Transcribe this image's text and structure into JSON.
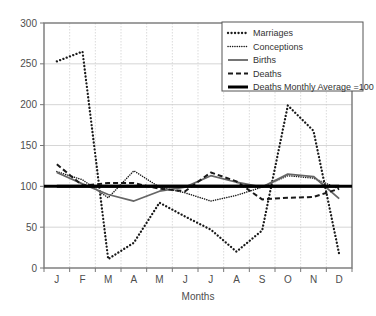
{
  "chart_data": {
    "type": "line",
    "title": "",
    "subtitle": "",
    "xlabel": "Months",
    "ylabel": "",
    "categories": [
      "J",
      "F",
      "M",
      "A",
      "M",
      "J",
      "J",
      "A",
      "S",
      "O",
      "N",
      "D"
    ],
    "category_names": [
      "January",
      "February",
      "March",
      "April",
      "May",
      "June",
      "July",
      "August",
      "September",
      "October",
      "November",
      "December"
    ],
    "ylim": [
      0,
      300
    ],
    "yticks": [
      0,
      50,
      100,
      150,
      200,
      250,
      300
    ],
    "ytick_labels": [
      "0",
      "50",
      "100",
      "150",
      "200",
      "250",
      "300"
    ],
    "grid": true,
    "grid_color": "#cccccc",
    "legend_position": "top-right",
    "reference_line": {
      "label": "Deaths Monthly Average =100",
      "value": 100,
      "color": "#000000"
    },
    "series": [
      {
        "name": "Marriages",
        "style": "dotted-coarse",
        "color": "#1a1a1a",
        "values": [
          253,
          265,
          11,
          31,
          80,
          63,
          47,
          20,
          46,
          199,
          168,
          17
        ]
      },
      {
        "name": "Conceptions",
        "style": "dotted-fine",
        "color": "#1a1a1a",
        "values": [
          118,
          108,
          86,
          119,
          99,
          92,
          82,
          89,
          99,
          113,
          110,
          97
        ]
      },
      {
        "name": "Births",
        "style": "solid",
        "color": "#666666",
        "values": [
          117,
          103,
          90,
          82,
          94,
          99,
          113,
          105,
          99,
          115,
          112,
          85
        ]
      },
      {
        "name": "Deaths",
        "style": "dashed",
        "color": "#1a1a1a",
        "values": [
          127,
          101,
          104,
          104,
          97,
          94,
          117,
          106,
          84,
          86,
          87,
          97
        ]
      },
      {
        "name": "Deaths Monthly Average =100",
        "style": "solid-thick",
        "color": "#000000",
        "values": [
          100,
          100,
          100,
          100,
          100,
          100,
          100,
          100,
          100,
          100,
          100,
          100
        ]
      }
    ]
  },
  "legend": {
    "items": [
      {
        "label": "Marriages"
      },
      {
        "label": "Conceptions"
      },
      {
        "label": "Births"
      },
      {
        "label": "Deaths"
      },
      {
        "label": "Deaths Monthly Average =100"
      }
    ]
  }
}
